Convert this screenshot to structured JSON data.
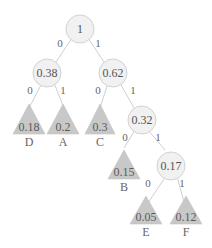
{
  "diagram": {
    "type": "huffman-tree",
    "internal_nodes": [
      {
        "id": "n1",
        "label": "1"
      },
      {
        "id": "n038",
        "label": "0.38"
      },
      {
        "id": "n062",
        "label": "0.62"
      },
      {
        "id": "n032",
        "label": "0.32"
      },
      {
        "id": "n017",
        "label": "0.17"
      }
    ],
    "leaves": [
      {
        "id": "D",
        "value": "0.18",
        "name": "D"
      },
      {
        "id": "A",
        "value": "0.2",
        "name": "A"
      },
      {
        "id": "C",
        "value": "0.3",
        "name": "C"
      },
      {
        "id": "B",
        "value": "0.15",
        "name": "B"
      },
      {
        "id": "E",
        "value": "0.05",
        "name": "E"
      },
      {
        "id": "F",
        "value": "0.12",
        "name": "F"
      }
    ],
    "edges": [
      {
        "from": "n1",
        "to": "n038",
        "bit": "0"
      },
      {
        "from": "n1",
        "to": "n062",
        "bit": "1"
      },
      {
        "from": "n038",
        "to": "D",
        "bit": "0"
      },
      {
        "from": "n038",
        "to": "A",
        "bit": "1"
      },
      {
        "from": "n062",
        "to": "C",
        "bit": "0"
      },
      {
        "from": "n062",
        "to": "n032",
        "bit": "1"
      },
      {
        "from": "n032",
        "to": "B",
        "bit": "0"
      },
      {
        "from": "n032",
        "to": "n017",
        "bit": "1"
      },
      {
        "from": "n017",
        "to": "E",
        "bit": "0"
      },
      {
        "from": "n017",
        "to": "F",
        "bit": "1"
      }
    ]
  }
}
